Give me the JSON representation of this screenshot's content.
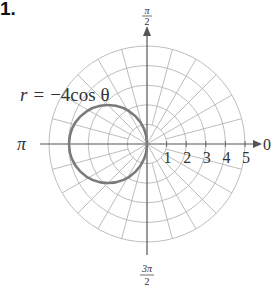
{
  "problem": {
    "number": "1."
  },
  "chart_data": {
    "type": "polar",
    "title": "",
    "equation_label": "r = −4cos θ",
    "equation": {
      "lhs": "r",
      "rhs": "−4cos θ"
    },
    "curve": {
      "description": "circle of diameter 4 centered at (r=2, θ=π)",
      "center_polar": [
        2,
        3.14159
      ],
      "radius": 2
    },
    "radial_ticks": [
      1,
      2,
      3,
      4,
      5
    ],
    "r_max": 5,
    "angle_labels": {
      "right": "0",
      "top": "π/2",
      "left": "π",
      "bottom": "3π/2"
    },
    "angle_label_parts": {
      "top": {
        "num": "π",
        "den": "2"
      },
      "bottom": {
        "num": "3π",
        "den": "2"
      },
      "left": "π",
      "right": "0"
    },
    "angular_grid_step_deg": 15,
    "grid": true,
    "colors": {
      "grid": "#b5b5b5",
      "axis": "#555555",
      "curve": "#777777",
      "text": "#333333"
    }
  }
}
